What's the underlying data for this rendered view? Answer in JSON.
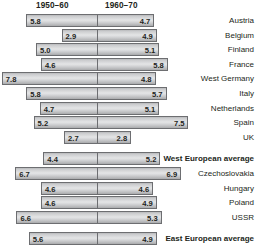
{
  "chart_data": {
    "type": "bar",
    "title": "",
    "subtitle": "",
    "xlabel": "",
    "ylabel": "",
    "orientation": "horizontal",
    "style": "diverging-bidirectional",
    "grid": false,
    "legend_position": "top",
    "axis_note": "Bars diverge left and right from a central vertical divider; left segment length encodes the 1950-60 value, right segment length encodes the 1960-70 value.",
    "headers": [
      "1950–60",
      "1960–70"
    ],
    "series": [
      {
        "name": "1950–60",
        "values": [
          5.8,
          2.9,
          5.0,
          4.6,
          7.8,
          5.8,
          4.7,
          5.2,
          2.7,
          4.4,
          6.7,
          4.6,
          4.6,
          6.6,
          5.6
        ]
      },
      {
        "name": "1960–70",
        "values": [
          4.7,
          4.9,
          5.1,
          5.8,
          4.8,
          5.7,
          5.1,
          7.5,
          2.8,
          5.2,
          6.9,
          4.6,
          4.9,
          5.3,
          4.9
        ]
      }
    ],
    "categories": [
      "Austria",
      "Belgium",
      "Finland",
      "France",
      "West Germany",
      "Italy",
      "Netherlands",
      "Spain",
      "UK",
      "West European average",
      "Czechoslovakia",
      "Hungary",
      "Poland",
      "USSR",
      "East European average"
    ],
    "xlim": [
      0,
      8
    ],
    "colors": {
      "bar_fill_light": "#e4e5e6",
      "bar_fill_mid": "#cdced0",
      "bar_fill_dark": "#a9aaac",
      "bar_border": "#6d6e71",
      "text": "#231f20",
      "background": "#ffffff"
    }
  },
  "header": {
    "left_label": "1950–60",
    "right_label": "1960–70"
  },
  "rows": [
    {
      "label": "Austria",
      "left": "5.8",
      "right": "4.7",
      "left_value": 5.8,
      "right_value": 4.7,
      "is_average": false,
      "group": "west"
    },
    {
      "label": "Belgium",
      "left": "2.9",
      "right": "4.9",
      "left_value": 2.9,
      "right_value": 4.9,
      "is_average": false,
      "group": "west"
    },
    {
      "label": "Finland",
      "left": "5.0",
      "right": "5.1",
      "left_value": 5.0,
      "right_value": 5.1,
      "is_average": false,
      "group": "west"
    },
    {
      "label": "France",
      "left": "4.6",
      "right": "5.8",
      "left_value": 4.6,
      "right_value": 5.8,
      "is_average": false,
      "group": "west"
    },
    {
      "label": "West Germany",
      "left": "7.8",
      "right": "4.8",
      "left_value": 7.8,
      "right_value": 4.8,
      "is_average": false,
      "group": "west"
    },
    {
      "label": "Italy",
      "left": "5.8",
      "right": "5.7",
      "left_value": 5.8,
      "right_value": 5.7,
      "is_average": false,
      "group": "west"
    },
    {
      "label": "Netherlands",
      "left": "4.7",
      "right": "5.1",
      "left_value": 4.7,
      "right_value": 5.1,
      "is_average": false,
      "group": "west"
    },
    {
      "label": "Spain",
      "left": "5.2",
      "right": "7.5",
      "left_value": 5.2,
      "right_value": 7.5,
      "is_average": false,
      "group": "west"
    },
    {
      "label": "UK",
      "left": "2.7",
      "right": "2.8",
      "left_value": 2.7,
      "right_value": 2.8,
      "is_average": false,
      "group": "west"
    },
    {
      "label": "West European average",
      "left": "4.4",
      "right": "5.2",
      "left_value": 4.4,
      "right_value": 5.2,
      "is_average": true,
      "group": "west-avg"
    },
    {
      "label": "Czechoslovakia",
      "left": "6.7",
      "right": "6.9",
      "left_value": 6.7,
      "right_value": 6.9,
      "is_average": false,
      "group": "east"
    },
    {
      "label": "Hungary",
      "left": "4.6",
      "right": "4.6",
      "left_value": 4.6,
      "right_value": 4.6,
      "is_average": false,
      "group": "east"
    },
    {
      "label": "Poland",
      "left": "4.6",
      "right": "4.9",
      "left_value": 4.6,
      "right_value": 4.9,
      "is_average": false,
      "group": "east"
    },
    {
      "label": "USSR",
      "left": "6.6",
      "right": "5.3",
      "left_value": 6.6,
      "right_value": 5.3,
      "is_average": false,
      "group": "east"
    },
    {
      "label": "East European average",
      "left": "5.6",
      "right": "4.9",
      "left_value": 5.6,
      "right_value": 4.9,
      "is_average": true,
      "group": "east-avg"
    }
  ]
}
